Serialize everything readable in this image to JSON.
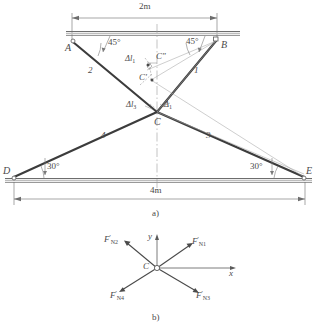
{
  "figure": {
    "title_a": "a)",
    "title_b": "b)",
    "dimensions": {
      "top_span": "2m",
      "bottom_span": "4m"
    },
    "angles": {
      "at_A": "45°",
      "at_B": "45°",
      "at_D": "30°",
      "at_E": "30°"
    },
    "nodes": {
      "A": "A",
      "B": "B",
      "C": "C",
      "D": "D",
      "E": "E",
      "C_prime": "C'",
      "C_double_prime": "C\""
    },
    "members": {
      "m1": "1",
      "m2": "2",
      "m3": "3",
      "m4": "4"
    },
    "deformations": {
      "dl1_upper": "Δl",
      "dl1_upper_sub": "1",
      "dl3_at_C": "Δl",
      "dl3_at_C_sub": "3",
      "d1_at_C": "Δ",
      "d1_at_C_sub": "1"
    },
    "fbd": {
      "origin_label": "C",
      "axis_x": "x",
      "axis_y": "y",
      "forces": [
        {
          "name": "F",
          "prime": "'",
          "sub": "N1",
          "direction": "upper-right"
        },
        {
          "name": "F",
          "prime": "'",
          "sub": "N2",
          "direction": "upper-left"
        },
        {
          "name": "F",
          "prime": "'",
          "sub": "N3",
          "direction": "lower-right"
        },
        {
          "name": "F",
          "prime": "'",
          "sub": "N4",
          "direction": "lower-left"
        }
      ]
    },
    "colors": {
      "line": "#4a4a4a",
      "member": "#3c3c3c",
      "thin": "#8c8c8c",
      "background": "#ffffff"
    }
  }
}
